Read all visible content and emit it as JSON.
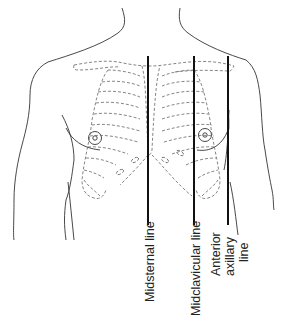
{
  "diagram": {
    "labels": {
      "midsternal": "Midsternal line",
      "midclavicular": "Midclavicular line",
      "anterior_axillary_1": "Anterior",
      "anterior_axillary_2": "axillary",
      "anterior_axillary_3": "line"
    },
    "colors": {
      "outline": "#333333",
      "rib_dash": "#666666",
      "landmark_line": "#111111"
    }
  }
}
